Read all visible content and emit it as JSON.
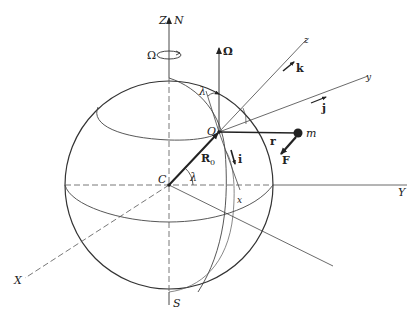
{
  "diagram": {
    "colors": {
      "stroke": "#333333",
      "background": "#ffffff"
    },
    "labels": {
      "Z": "Z",
      "N": "N",
      "S": "S",
      "X": "X",
      "Y": "Y",
      "Omega_rot": "Ω",
      "Omega_vec": "Ω",
      "O": "O",
      "C": "C",
      "R0": "R",
      "R0_sub": "0",
      "lambda_top": "λ",
      "lambda_center": "λ",
      "x": "x",
      "y": "y",
      "z": "z",
      "i": "i",
      "j": "j",
      "k": "k",
      "r": "r",
      "m": "m",
      "F": "F"
    }
  }
}
